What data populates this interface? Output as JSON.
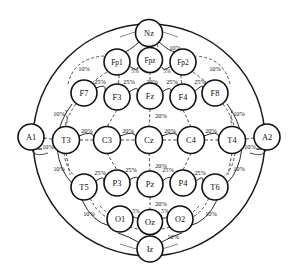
{
  "figure": {
    "type": "diagram",
    "background_color": "#ffffff",
    "outline_color": "#1a1a1a",
    "node_fill": "#ffffff",
    "node_stroke": "#111111",
    "link_color": "#3a3a3a"
  },
  "head": {
    "center_x": 149,
    "center_y": 140,
    "radius_x": 116,
    "radius_y": 116
  },
  "electrodes": [
    {
      "id": "Nz",
      "label": "Nz",
      "x": 149,
      "y": 33,
      "r": 13.5,
      "group": "landmark"
    },
    {
      "id": "Fp1",
      "label": "Fp1",
      "x": 117,
      "y": 62,
      "r": 13.0,
      "group": "prefrontal"
    },
    {
      "id": "Fpz",
      "label": "Fpz",
      "x": 150,
      "y": 60,
      "r": 12.5,
      "group": "prefrontal"
    },
    {
      "id": "Fp2",
      "label": "Fp2",
      "x": 183,
      "y": 62,
      "r": 13.0,
      "group": "prefrontal"
    },
    {
      "id": "F7",
      "label": "F7",
      "x": 84,
      "y": 93,
      "r": 13.0,
      "group": "frontal"
    },
    {
      "id": "F3",
      "label": "F3",
      "x": 117,
      "y": 97,
      "r": 13.0,
      "group": "frontal"
    },
    {
      "id": "Fz",
      "label": "Fz",
      "x": 150,
      "y": 96,
      "r": 13.0,
      "group": "frontal"
    },
    {
      "id": "F4",
      "label": "F4",
      "x": 183,
      "y": 97,
      "r": 13.0,
      "group": "frontal"
    },
    {
      "id": "F8",
      "label": "F8",
      "x": 215,
      "y": 93,
      "r": 13.0,
      "group": "frontal"
    },
    {
      "id": "A1",
      "label": "A1",
      "x": 31,
      "y": 137,
      "r": 13.0,
      "group": "ear"
    },
    {
      "id": "T3",
      "label": "T3",
      "x": 66,
      "y": 140,
      "r": 13.5,
      "group": "temporal"
    },
    {
      "id": "C3",
      "label": "C3",
      "x": 107,
      "y": 140,
      "r": 13.5,
      "group": "central"
    },
    {
      "id": "Cz",
      "label": "Cz",
      "x": 149,
      "y": 140,
      "r": 13.5,
      "group": "central"
    },
    {
      "id": "C4",
      "label": "C4",
      "x": 191,
      "y": 140,
      "r": 13.5,
      "group": "central"
    },
    {
      "id": "T4",
      "label": "T4",
      "x": 232,
      "y": 140,
      "r": 13.5,
      "group": "temporal"
    },
    {
      "id": "A2",
      "label": "A2",
      "x": 267,
      "y": 137,
      "r": 13.0,
      "group": "ear"
    },
    {
      "id": "T5",
      "label": "T5",
      "x": 84,
      "y": 187,
      "r": 13.0,
      "group": "temporal"
    },
    {
      "id": "P3",
      "label": "P3",
      "x": 117,
      "y": 183,
      "r": 13.0,
      "group": "parietal"
    },
    {
      "id": "Pz",
      "label": "Pz",
      "x": 150,
      "y": 184,
      "r": 13.0,
      "group": "parietal"
    },
    {
      "id": "P4",
      "label": "P4",
      "x": 183,
      "y": 183,
      "r": 13.0,
      "group": "parietal"
    },
    {
      "id": "T6",
      "label": "T6",
      "x": 215,
      "y": 187,
      "r": 13.0,
      "group": "temporal"
    },
    {
      "id": "O1",
      "label": "O1",
      "x": 120,
      "y": 219,
      "r": 13.0,
      "group": "occipital"
    },
    {
      "id": "Oz",
      "label": "Oz",
      "x": 150,
      "y": 222,
      "r": 12.5,
      "group": "occipital"
    },
    {
      "id": "O2",
      "label": "O2",
      "x": 180,
      "y": 219,
      "r": 13.0,
      "group": "occipital"
    },
    {
      "id": "Iz",
      "label": "Iz",
      "x": 150,
      "y": 249,
      "r": 13.0,
      "group": "landmark"
    }
  ],
  "distance_labels": [
    {
      "id": "nz-fpz",
      "text": "10%",
      "x": 175,
      "y": 47
    },
    {
      "id": "fp1-fpz",
      "text": "5%",
      "x": 135,
      "y": 71
    },
    {
      "id": "fpz-fp2",
      "text": "5%",
      "x": 167,
      "y": 71
    },
    {
      "id": "fp1-outer",
      "text": "10%",
      "x": 84,
      "y": 68
    },
    {
      "id": "fp2-outer",
      "text": "10%",
      "x": 215,
      "y": 68
    },
    {
      "id": "f7-f3",
      "text": "25%",
      "x": 100,
      "y": 81
    },
    {
      "id": "f3-fz",
      "text": "25%",
      "x": 129,
      "y": 81
    },
    {
      "id": "fz-f4",
      "text": "25%",
      "x": 172,
      "y": 81
    },
    {
      "id": "f4-f8",
      "text": "25%",
      "x": 200,
      "y": 81
    },
    {
      "id": "fpz-fz",
      "text": "20%",
      "x": 152,
      "y": 81
    },
    {
      "id": "f7-t3",
      "text": "10%",
      "x": 59,
      "y": 113
    },
    {
      "id": "f8-t4",
      "text": "10%",
      "x": 239,
      "y": 113
    },
    {
      "id": "a1-t3",
      "text": "10%",
      "x": 48,
      "y": 146
    },
    {
      "id": "t4-a2",
      "text": "10%",
      "x": 250,
      "y": 146
    },
    {
      "id": "t3-c3",
      "text": "20%",
      "x": 87,
      "y": 130
    },
    {
      "id": "c3-cz",
      "text": "20%",
      "x": 128,
      "y": 130
    },
    {
      "id": "cz-c4",
      "text": "20%",
      "x": 170,
      "y": 130
    },
    {
      "id": "c4-t4",
      "text": "20%",
      "x": 211,
      "y": 130
    },
    {
      "id": "fz-cz",
      "text": "20%",
      "x": 161,
      "y": 115
    },
    {
      "id": "cz-pz",
      "text": "20%",
      "x": 161,
      "y": 165
    },
    {
      "id": "t3-t5",
      "text": "10%",
      "x": 59,
      "y": 168
    },
    {
      "id": "t4-t6",
      "text": "10%",
      "x": 239,
      "y": 168
    },
    {
      "id": "t5-p3",
      "text": "25%",
      "x": 100,
      "y": 172
    },
    {
      "id": "p3-pz",
      "text": "25%",
      "x": 131,
      "y": 169
    },
    {
      "id": "pz-p4",
      "text": "25%",
      "x": 168,
      "y": 169
    },
    {
      "id": "p4-t6",
      "text": "25%",
      "x": 200,
      "y": 172
    },
    {
      "id": "pz-oz",
      "text": "20%",
      "x": 161,
      "y": 203
    },
    {
      "id": "t5-o1",
      "text": "10%",
      "x": 89,
      "y": 213
    },
    {
      "id": "t6-o2",
      "text": "10%",
      "x": 211,
      "y": 213
    },
    {
      "id": "o1-oz",
      "text": "5%",
      "x": 136,
      "y": 211
    },
    {
      "id": "oz-o2",
      "text": "5%",
      "x": 165,
      "y": 211
    },
    {
      "id": "oz-iz",
      "text": "10%",
      "x": 173,
      "y": 236
    }
  ]
}
